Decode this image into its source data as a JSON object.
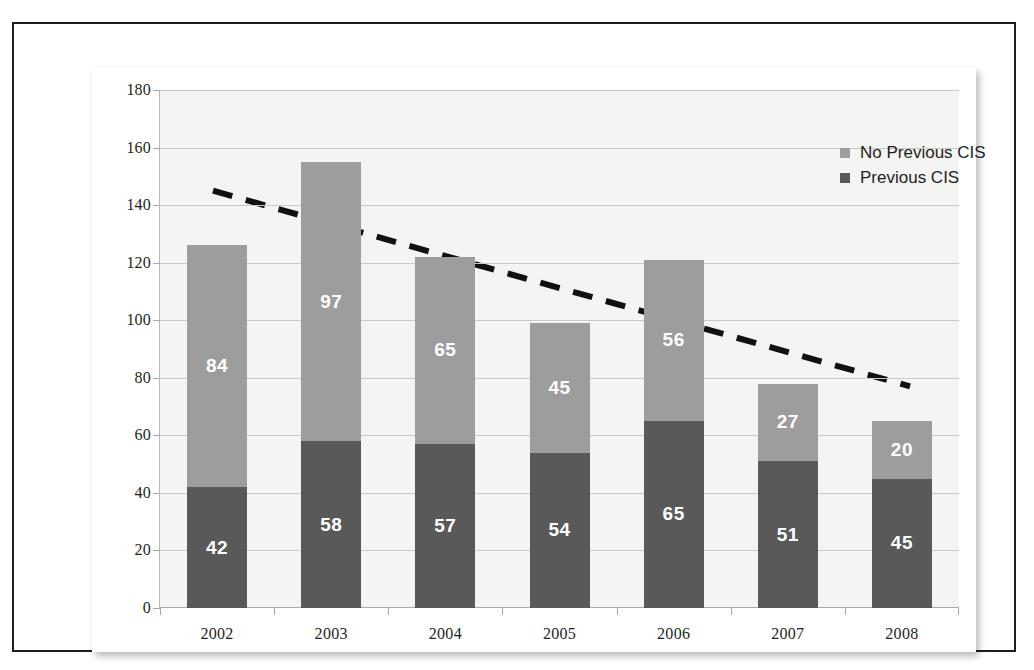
{
  "chart_data": {
    "type": "bar",
    "subtype": "stacked-bar-with-trendline",
    "title": "",
    "xlabel": "",
    "ylabel": "",
    "categories": [
      "2002",
      "2003",
      "2004",
      "2005",
      "2006",
      "2007",
      "2008"
    ],
    "ylim": [
      0,
      180
    ],
    "yticks": [
      0,
      20,
      40,
      60,
      80,
      100,
      120,
      140,
      160,
      180
    ],
    "ytick_labels": [
      "0",
      "20",
      "40",
      "60",
      "80",
      "100",
      "120",
      "140",
      "160",
      "180"
    ],
    "grid": true,
    "legend_position": "top-right",
    "series": [
      {
        "name": "Previous CIS",
        "color": "#595959",
        "stack_position": "bottom",
        "values": [
          42,
          58,
          57,
          54,
          65,
          51,
          45
        ],
        "labels": [
          "42",
          "58",
          "57",
          "54",
          "65",
          "51",
          "45"
        ]
      },
      {
        "name": "No Previous CIS",
        "color": "#9d9d9d",
        "stack_position": "top",
        "values": [
          84,
          97,
          65,
          45,
          56,
          27,
          20
        ],
        "labels": [
          "84",
          "97",
          "65",
          "45",
          "56",
          "27",
          "20"
        ]
      }
    ],
    "totals": [
      126,
      155,
      122,
      99,
      121,
      78,
      65
    ],
    "trendline": {
      "style": "dashed",
      "color": "#111111",
      "start_value": 145,
      "end_value": 77,
      "start_category": "2002",
      "end_category": "2008"
    }
  },
  "legend": {
    "items": [
      {
        "label": "No Previous CIS",
        "color": "#9d9d9d"
      },
      {
        "label": "Previous CIS",
        "color": "#595959"
      }
    ]
  },
  "colors": {
    "series_top": "#9d9d9d",
    "series_bottom": "#595959",
    "plot_background": "#f4f4f2",
    "gridline": "#c9c9c7",
    "frame": "#1d1d1d",
    "trendline": "#111111",
    "text": "#231f20"
  }
}
